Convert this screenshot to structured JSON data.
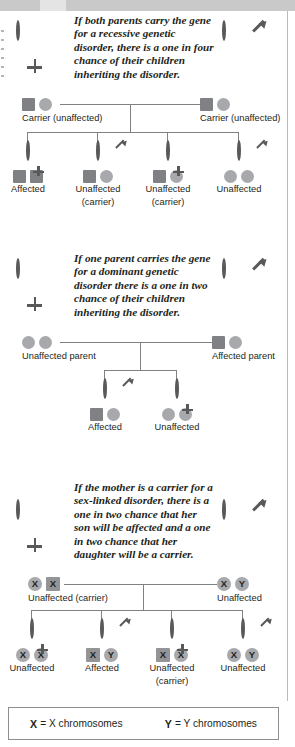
{
  "legend": {
    "x_key": "X",
    "x_text": "= X chromosomes",
    "y_key": "Y",
    "y_text": "= Y chromosomes"
  },
  "sections": [
    {
      "id": "recessive",
      "caption": "If both parents carry the gene for a recessive genetic disorder, there is a one in four chance of their children inheriting the disorder.",
      "mother_symbol": "female-symbol",
      "father_symbol": "male-symbol",
      "parents": [
        {
          "label": "Carrier (unaffected)",
          "alleles": [
            "square",
            "circle"
          ]
        },
        {
          "label": "Carrier (unaffected)",
          "alleles": [
            "square",
            "circle"
          ]
        }
      ],
      "children": [
        {
          "sex": "female",
          "alleles": [
            "square",
            "square"
          ],
          "label": "Affected",
          "sublabel": ""
        },
        {
          "sex": "male",
          "alleles": [
            "square",
            "circle"
          ],
          "label": "Unaffected",
          "sublabel": "(carrier)"
        },
        {
          "sex": "female",
          "alleles": [
            "square",
            "circle"
          ],
          "label": "Unaffected",
          "sublabel": "(carrier)"
        },
        {
          "sex": "male",
          "alleles": [
            "circle",
            "circle"
          ],
          "label": "Unaffected",
          "sublabel": ""
        }
      ]
    },
    {
      "id": "dominant",
      "caption": "If one parent carries the gene for a dominant genetic disorder there is a one in two chance of their children inheriting the disorder.",
      "mother_symbol": "female-symbol",
      "father_symbol": "male-symbol",
      "parents": [
        {
          "label": "Unaffected parent",
          "alleles": [
            "circle",
            "circle"
          ]
        },
        {
          "label": "Affected parent",
          "alleles": [
            "square",
            "circle"
          ]
        }
      ],
      "children": [
        {
          "sex": "male",
          "alleles": [
            "square",
            "circle"
          ],
          "label": "Affected",
          "sublabel": ""
        },
        {
          "sex": "female",
          "alleles": [
            "circle",
            "circle"
          ],
          "label": "Unaffected",
          "sublabel": ""
        }
      ]
    },
    {
      "id": "sex-linked",
      "caption": "If the mother is a carrier for a sex-linked disorder, there is a one in two chance that her son will be affected and a one in two chance that her daughter will be a carrier.",
      "mother_symbol": "female-symbol",
      "father_symbol": "male-symbol",
      "parents": [
        {
          "label": "Unaffected (carrier)",
          "alleles": [
            "x-circle",
            "x-square"
          ]
        },
        {
          "label": "Unaffected",
          "alleles": [
            "x-circle",
            "y-circle"
          ]
        }
      ],
      "children": [
        {
          "sex": "female",
          "alleles": [
            "x-circle",
            "x-circle"
          ],
          "label": "Unaffected",
          "sublabel": ""
        },
        {
          "sex": "male",
          "alleles": [
            "x-square",
            "y-circle"
          ],
          "label": "Affected",
          "sublabel": ""
        },
        {
          "sex": "female",
          "alleles": [
            "x-square",
            "x-circle"
          ],
          "label": "Unaffected",
          "sublabel": "(carrier)"
        },
        {
          "sex": "male",
          "alleles": [
            "x-circle",
            "y-circle"
          ],
          "label": "Unaffected",
          "sublabel": ""
        }
      ]
    }
  ],
  "colors": {
    "affected_square": "#808184",
    "normal_circle": "#a7a9ac",
    "outline": "#58595b",
    "line": "#808184"
  }
}
